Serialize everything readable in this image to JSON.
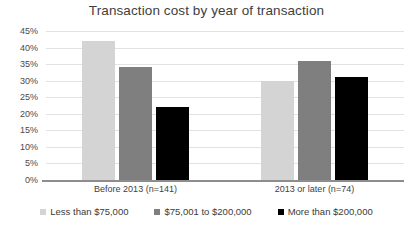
{
  "chart_data": {
    "type": "bar",
    "title": "Transaction cost by year of transaction",
    "xlabel": "",
    "ylabel": "",
    "ylim": [
      0,
      45
    ],
    "ytick_labels": [
      "0%",
      "5%",
      "10%",
      "15%",
      "20%",
      "25%",
      "30%",
      "35%",
      "40%",
      "45%"
    ],
    "ytick_values": [
      0,
      5,
      10,
      15,
      20,
      25,
      30,
      35,
      40,
      45
    ],
    "grid": true,
    "legend_position": "bottom",
    "categories": [
      "Before 2013 (n=141)",
      "2013 or later (n=74)"
    ],
    "series": [
      {
        "name": "Less than $75,000",
        "color": "#d4d4d4",
        "values": [
          42,
          30
        ]
      },
      {
        "name": "$75,001 to $200,000",
        "color": "#7f7f7f",
        "values": [
          34,
          36
        ]
      },
      {
        "name": "More than $200,000",
        "color": "#000000",
        "values": [
          22,
          31
        ]
      }
    ]
  }
}
